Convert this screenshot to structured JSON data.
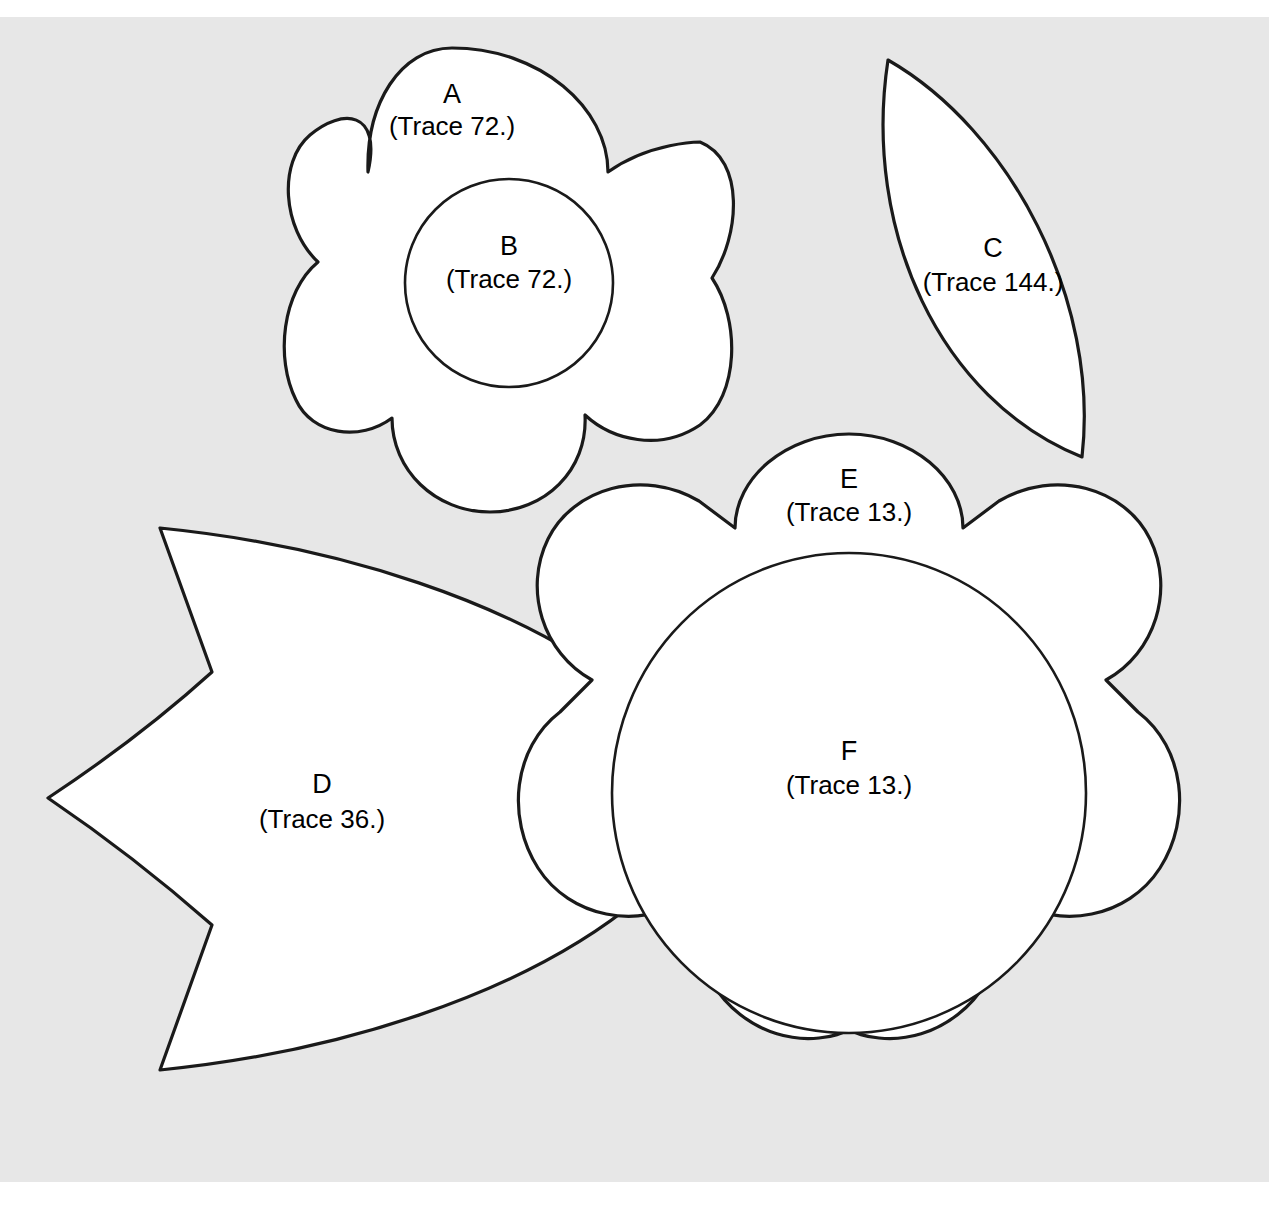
{
  "page": {
    "background_color": "#e7e7e7",
    "paper_color": "#ffffff",
    "line_color": "#1a1a1a",
    "fill_color": "#ffffff",
    "width": 1269,
    "height": 1212
  },
  "pieces": [
    {
      "id": "A",
      "letter": "A",
      "trace": "(Trace 72.)",
      "shape": "five-petal-flower",
      "trace_count": 72,
      "label_x": 452,
      "label_y": 96,
      "label_trace_y": 128
    },
    {
      "id": "B",
      "letter": "B",
      "trace": "(Trace 72.)",
      "shape": "circle",
      "trace_count": 72,
      "label_x": 509,
      "label_y": 248,
      "label_trace_y": 281
    },
    {
      "id": "C",
      "letter": "C",
      "trace": "(Trace 144.)",
      "shape": "pointed-leaf",
      "trace_count": 144,
      "label_x": 993,
      "label_y": 250,
      "label_trace_y": 284
    },
    {
      "id": "D",
      "letter": "D",
      "trace": "(Trace 36.)",
      "shape": "notched-leaf",
      "trace_count": 36,
      "label_x": 322,
      "label_y": 786,
      "label_trace_y": 821
    },
    {
      "id": "E",
      "letter": "E",
      "trace": "(Trace 13.)",
      "shape": "eight-lobe-scalloped-flower",
      "trace_count": 13,
      "label_x": 849,
      "label_y": 481,
      "label_trace_y": 514
    },
    {
      "id": "F",
      "letter": "F",
      "trace": "(Trace 13.)",
      "shape": "circle",
      "trace_count": 13,
      "label_x": 849,
      "label_y": 753,
      "label_trace_y": 787
    }
  ]
}
